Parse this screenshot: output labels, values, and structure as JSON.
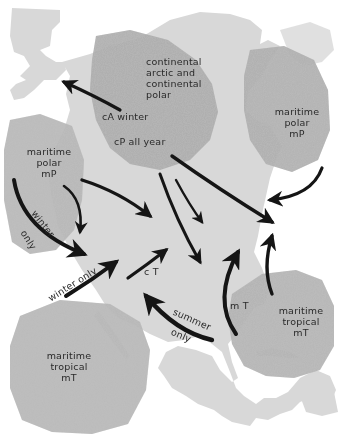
{
  "map": {
    "title": "North American air masses",
    "colors": {
      "land": "#d6d6d6",
      "source_region": "#a9a9a9",
      "source_region_dark": "#8f8f8f",
      "arrow": "#151515",
      "text": "#2a2a2a",
      "background": "#ffffff"
    }
  },
  "regions": {
    "continental_arctic_polar": {
      "lines": [
        "continental",
        "arctic and",
        "continental",
        "polar"
      ],
      "code_winter": "cA winter",
      "code_all_year": "cP all year"
    },
    "maritime_polar_pacific": {
      "lines": [
        "maritime",
        "polar",
        "mP"
      ]
    },
    "maritime_polar_atlantic": {
      "lines": [
        "maritime",
        "polar",
        "mP"
      ]
    },
    "maritime_tropical_pacific": {
      "lines": [
        "maritime",
        "tropical",
        "mT"
      ]
    },
    "maritime_tropical_atlantic": {
      "lines": [
        "maritime",
        "tropical",
        "mT"
      ]
    },
    "gulf_tropical": {
      "code": "m T"
    },
    "continental_tropical": {
      "code": "c T"
    }
  },
  "arrow_labels": {
    "pacific_winter_only_1": "winter",
    "pacific_winter_only_2": "only",
    "pacific_tropical_winter_only": "winter only",
    "gulf_summer_only_1": "summer",
    "gulf_summer_only_2": "only"
  },
  "arrows": [
    {
      "id": "cA-to-alaska",
      "from": "continental arctic",
      "to": "Alaska"
    },
    {
      "id": "cP-southeast-long",
      "from": "cP",
      "to": "east coast"
    },
    {
      "id": "cP-south-1",
      "from": "cP",
      "to": "central plains"
    },
    {
      "id": "cP-south-2",
      "from": "cP",
      "to": "southern plains"
    },
    {
      "id": "mP-pacific-east",
      "from": "Pacific mP",
      "to": "interior"
    },
    {
      "id": "mP-pacific-south",
      "from": "Pacific mP",
      "to": "west coast"
    },
    {
      "id": "mP-pacific-winter",
      "from": "Pacific mP",
      "to": "southwest",
      "note": "winter only"
    },
    {
      "id": "mT-pacific-winter",
      "from": "Pacific mT",
      "to": "southwest",
      "note": "winter only"
    },
    {
      "id": "cT-northeast",
      "from": "cT",
      "to": "plains"
    },
    {
      "id": "mT-gulf-summer",
      "from": "Gulf mT",
      "to": "Mexico/southwest",
      "note": "summer only"
    },
    {
      "id": "mT-gulf-north",
      "from": "Gulf mT",
      "to": "Mississippi valley"
    },
    {
      "id": "mT-atlantic-north",
      "from": "Atlantic mT",
      "to": "east coast"
    },
    {
      "id": "mP-atlantic-southwest",
      "from": "Atlantic mP",
      "to": "New England"
    }
  ]
}
